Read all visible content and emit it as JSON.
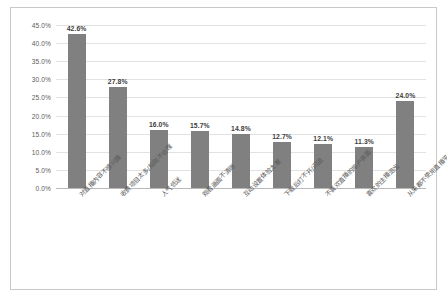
{
  "chart_data": {
    "type": "bar",
    "title": "",
    "subtitle": "",
    "xlabel": "",
    "ylabel": "",
    "ylim": [
      0,
      45
    ],
    "grid": true,
    "legend": "none",
    "orientation": "vertical",
    "bar_color": "#808080",
    "categories": [
      "对直播内容不感兴趣",
      "收费项目太多/规则不合理",
      "人气低迷",
      "观看画面不清晰",
      "互动设置体验太差",
      "下载后打不开/闪退",
      "不喜欢直播的用户界面",
      "喜欢的主播退出",
      "从来都不使用直播平台，不太了解"
    ],
    "values": [
      42.6,
      27.8,
      16.0,
      15.7,
      14.8,
      12.7,
      12.1,
      11.3,
      24.0
    ],
    "value_labels": [
      "42.6%",
      "27.8%",
      "16.0%",
      "15.7%",
      "14.8%",
      "12.7%",
      "12.1%",
      "11.3%",
      "24.0%"
    ],
    "yticks": [
      0,
      5,
      10,
      15,
      20,
      25,
      30,
      35,
      40,
      45
    ],
    "ytick_labels": [
      "0.0%",
      "5.0%",
      "10.0%",
      "15.0%",
      "20.0%",
      "25.0%",
      "30.0%",
      "35.0%",
      "40.0%",
      "45.0%"
    ]
  }
}
